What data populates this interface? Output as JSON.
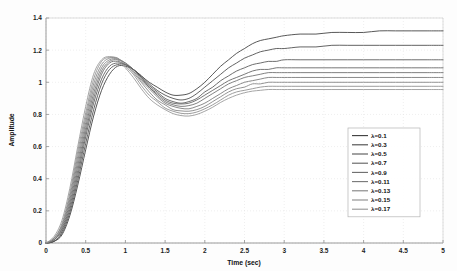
{
  "chart_data": {
    "type": "line",
    "title": "",
    "xlabel": "Time (sec)",
    "ylabel": "Amplitude",
    "xlim": [
      0,
      5
    ],
    "ylim": [
      0,
      1.4
    ],
    "xticks": [
      "0",
      "0.5",
      "1",
      "1.5",
      "2",
      "2.5",
      "3",
      "3.5",
      "4",
      "4.5",
      "5"
    ],
    "yticks": [
      "0",
      "0.2",
      "0.4",
      "0.6",
      "0.8",
      "1",
      "1.2",
      "1.4"
    ],
    "grid": true,
    "legend_position": "lower-right",
    "legend_entries": [
      "λ=0.1",
      "λ=0.3",
      "λ=0.5",
      "λ=0.7",
      "λ=0.9",
      "λ=0.11",
      "λ=0.13",
      "λ=0.15",
      "λ=0.17"
    ],
    "x": [
      0,
      0.1,
      0.2,
      0.3,
      0.4,
      0.5,
      0.6,
      0.7,
      0.8,
      0.9,
      1.0,
      1.1,
      1.2,
      1.3,
      1.4,
      1.5,
      1.6,
      1.7,
      1.8,
      1.9,
      2.0,
      2.1,
      2.2,
      2.3,
      2.4,
      2.5,
      2.6,
      2.7,
      2.8,
      2.9,
      3.0,
      3.2,
      3.4,
      3.6,
      3.8,
      4.0,
      4.2,
      4.4,
      4.6,
      4.8,
      5.0
    ],
    "series": [
      {
        "name": "λ=0.1",
        "color": "#3a3a3a",
        "steady_state": 1.32,
        "peak": 1.1,
        "peak_time": 1.05,
        "dip": 0.92,
        "dip_time": 1.7,
        "values": [
          0,
          0.01,
          0.05,
          0.17,
          0.36,
          0.58,
          0.79,
          0.95,
          1.05,
          1.1,
          1.1,
          1.08,
          1.04,
          1.0,
          0.97,
          0.94,
          0.92,
          0.92,
          0.93,
          0.96,
          1.0,
          1.05,
          1.1,
          1.14,
          1.18,
          1.21,
          1.24,
          1.26,
          1.27,
          1.28,
          1.29,
          1.3,
          1.3,
          1.31,
          1.31,
          1.31,
          1.32,
          1.32,
          1.32,
          1.32,
          1.32
        ]
      },
      {
        "name": "λ=0.3",
        "color": "#474747",
        "steady_state": 1.23,
        "peak": 1.11,
        "peak_time": 1.0,
        "dip": 0.9,
        "dip_time": 1.72,
        "values": [
          0,
          0.01,
          0.06,
          0.19,
          0.39,
          0.62,
          0.83,
          0.99,
          1.08,
          1.11,
          1.11,
          1.08,
          1.04,
          0.99,
          0.95,
          0.92,
          0.9,
          0.89,
          0.9,
          0.93,
          0.97,
          1.01,
          1.05,
          1.09,
          1.12,
          1.15,
          1.17,
          1.19,
          1.2,
          1.21,
          1.21,
          1.22,
          1.22,
          1.23,
          1.23,
          1.23,
          1.23,
          1.23,
          1.23,
          1.23,
          1.23
        ]
      },
      {
        "name": "λ=0.5",
        "color": "#545454",
        "steady_state": 1.14,
        "peak": 1.12,
        "peak_time": 0.97,
        "dip": 0.88,
        "dip_time": 1.74,
        "values": [
          0,
          0.01,
          0.07,
          0.21,
          0.42,
          0.66,
          0.87,
          1.02,
          1.1,
          1.12,
          1.11,
          1.08,
          1.03,
          0.98,
          0.94,
          0.9,
          0.88,
          0.87,
          0.88,
          0.9,
          0.94,
          0.97,
          1.01,
          1.04,
          1.07,
          1.09,
          1.11,
          1.12,
          1.13,
          1.13,
          1.14,
          1.14,
          1.14,
          1.14,
          1.14,
          1.14,
          1.14,
          1.14,
          1.14,
          1.14,
          1.14
        ]
      },
      {
        "name": "λ=0.7",
        "color": "#5f5f5f",
        "steady_state": 1.09,
        "peak": 1.13,
        "peak_time": 0.95,
        "dip": 0.865,
        "dip_time": 1.76,
        "values": [
          0,
          0.02,
          0.08,
          0.23,
          0.45,
          0.69,
          0.9,
          1.05,
          1.12,
          1.13,
          1.11,
          1.08,
          1.03,
          0.97,
          0.93,
          0.89,
          0.87,
          0.865,
          0.87,
          0.89,
          0.92,
          0.95,
          0.98,
          1.01,
          1.03,
          1.05,
          1.07,
          1.08,
          1.08,
          1.09,
          1.09,
          1.09,
          1.09,
          1.09,
          1.09,
          1.09,
          1.09,
          1.09,
          1.09,
          1.09,
          1.09
        ]
      },
      {
        "name": "λ=0.9",
        "color": "#6a6a6a",
        "steady_state": 1.06,
        "peak": 1.14,
        "peak_time": 0.93,
        "dip": 0.85,
        "dip_time": 1.78,
        "values": [
          0,
          0.02,
          0.09,
          0.25,
          0.48,
          0.72,
          0.93,
          1.07,
          1.13,
          1.14,
          1.12,
          1.08,
          1.02,
          0.97,
          0.92,
          0.88,
          0.86,
          0.85,
          0.855,
          0.87,
          0.9,
          0.93,
          0.96,
          0.99,
          1.01,
          1.03,
          1.04,
          1.05,
          1.06,
          1.06,
          1.06,
          1.06,
          1.06,
          1.06,
          1.06,
          1.06,
          1.06,
          1.06,
          1.06,
          1.06,
          1.06
        ]
      },
      {
        "name": "λ=0.11",
        "color": "#757575",
        "steady_state": 1.03,
        "peak": 1.145,
        "peak_time": 0.91,
        "dip": 0.835,
        "dip_time": 1.8,
        "values": [
          0,
          0.02,
          0.1,
          0.27,
          0.51,
          0.75,
          0.96,
          1.09,
          1.14,
          1.145,
          1.12,
          1.07,
          1.01,
          0.96,
          0.91,
          0.87,
          0.85,
          0.838,
          0.835,
          0.85,
          0.87,
          0.9,
          0.93,
          0.96,
          0.98,
          1.0,
          1.01,
          1.02,
          1.03,
          1.03,
          1.03,
          1.03,
          1.03,
          1.03,
          1.03,
          1.03,
          1.03,
          1.03,
          1.03,
          1.03,
          1.03
        ]
      },
      {
        "name": "λ=0.13",
        "color": "#808080",
        "steady_state": 1.0,
        "peak": 1.15,
        "peak_time": 0.89,
        "dip": 0.82,
        "dip_time": 1.82,
        "values": [
          0,
          0.03,
          0.11,
          0.29,
          0.54,
          0.78,
          0.99,
          1.11,
          1.15,
          1.15,
          1.11,
          1.06,
          1.0,
          0.94,
          0.89,
          0.86,
          0.83,
          0.822,
          0.82,
          0.83,
          0.85,
          0.88,
          0.91,
          0.94,
          0.96,
          0.97,
          0.99,
          0.99,
          1.0,
          1.0,
          1.0,
          1.0,
          1.0,
          1.0,
          1.0,
          1.0,
          1.0,
          1.0,
          1.0,
          1.0,
          1.0
        ]
      },
      {
        "name": "λ=0.15",
        "color": "#8b8b8b",
        "steady_state": 0.975,
        "peak": 1.155,
        "peak_time": 0.87,
        "dip": 0.805,
        "dip_time": 1.84,
        "values": [
          0,
          0.03,
          0.12,
          0.31,
          0.57,
          0.81,
          1.02,
          1.13,
          1.155,
          1.15,
          1.1,
          1.05,
          0.98,
          0.92,
          0.88,
          0.84,
          0.82,
          0.807,
          0.805,
          0.815,
          0.835,
          0.86,
          0.89,
          0.92,
          0.94,
          0.95,
          0.96,
          0.97,
          0.975,
          0.975,
          0.975,
          0.975,
          0.975,
          0.975,
          0.975,
          0.975,
          0.975,
          0.975,
          0.975,
          0.975,
          0.975
        ]
      },
      {
        "name": "λ=0.17",
        "color": "#959595",
        "steady_state": 0.955,
        "peak": 1.16,
        "peak_time": 0.85,
        "dip": 0.79,
        "dip_time": 1.86,
        "values": [
          0,
          0.04,
          0.14,
          0.34,
          0.6,
          0.85,
          1.05,
          1.14,
          1.16,
          1.14,
          1.09,
          1.03,
          0.96,
          0.9,
          0.86,
          0.83,
          0.805,
          0.793,
          0.79,
          0.8,
          0.82,
          0.845,
          0.875,
          0.9,
          0.92,
          0.935,
          0.945,
          0.95,
          0.955,
          0.955,
          0.955,
          0.955,
          0.955,
          0.955,
          0.955,
          0.955,
          0.955,
          0.955,
          0.955,
          0.955,
          0.955
        ]
      }
    ]
  },
  "figure": {
    "background": "#fdfdfd",
    "axis_color": "#9a9a9a",
    "grid_color": "#dedede",
    "legend_border": "#b4b4b4"
  }
}
